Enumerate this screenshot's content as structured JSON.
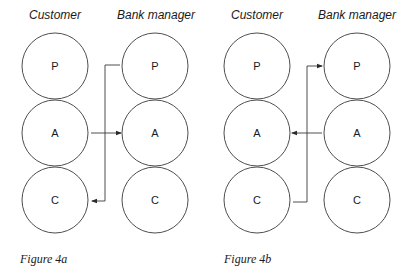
{
  "figures": [
    {
      "caption": "Figure 4a",
      "columns": [
        {
          "label": "Customer",
          "states": [
            "P",
            "A",
            "C"
          ]
        },
        {
          "label": "Bank manager",
          "states": [
            "P",
            "A",
            "C"
          ]
        }
      ],
      "transactions": [
        {
          "from": "Customer A",
          "to": "Bank manager A",
          "type": "stimulus"
        },
        {
          "from": "Bank manager P",
          "to": "Customer C",
          "type": "response"
        }
      ]
    },
    {
      "caption": "Figure 4b",
      "columns": [
        {
          "label": "Customer",
          "states": [
            "P",
            "A",
            "C"
          ]
        },
        {
          "label": "Bank manager",
          "states": [
            "P",
            "A",
            "C"
          ]
        }
      ],
      "transactions": [
        {
          "from": "Bank manager A",
          "to": "Customer A",
          "type": "stimulus"
        },
        {
          "from": "Customer C",
          "to": "Bank manager P",
          "type": "response"
        }
      ]
    }
  ]
}
